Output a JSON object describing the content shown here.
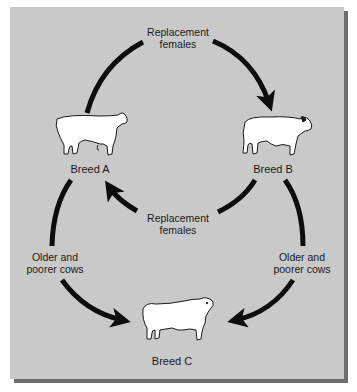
{
  "diagram": {
    "type": "three-breed rotational crossbreeding cycle",
    "background_color": "#c9c9c9",
    "arrow_color": "#0d0d0d",
    "nodes": [
      {
        "id": "breed_a",
        "label": "Breed A",
        "icon": "cow-icon"
      },
      {
        "id": "breed_b",
        "label": "Breed B",
        "icon": "bull-icon"
      },
      {
        "id": "breed_c",
        "label": "Breed C",
        "icon": "bull-icon"
      }
    ],
    "edges": [
      {
        "from": "breed_a",
        "to": "breed_b",
        "label_line1": "Replacement",
        "label_line2": "females"
      },
      {
        "from": "breed_b",
        "to": "breed_a",
        "label_line1": "Replacement",
        "label_line2": "females"
      },
      {
        "from": "breed_a",
        "to": "breed_c",
        "label_line1": "Older and",
        "label_line2": "poorer cows"
      },
      {
        "from": "breed_b",
        "to": "breed_c",
        "label_line1": "Older and",
        "label_line2": "poorer cows"
      }
    ]
  }
}
